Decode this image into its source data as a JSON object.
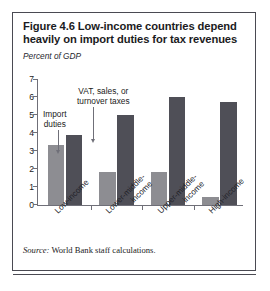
{
  "figure": {
    "title": "Figure 4.6  Low-income countries depend heavily on import duties for tax revenues",
    "source": "Source: World Bank staff calculations.",
    "source_prefix": "Source:",
    "source_body": " World Bank staff calculations."
  },
  "annotations": {
    "import_duties": "Import\nduties",
    "import_duties_line1": "Import",
    "import_duties_line2": "duties",
    "vat_line1": "VAT, sales, or",
    "vat_line2": "turnover taxes"
  },
  "colors": {
    "import_duties_bar": "#8d8d92",
    "vat_bar": "#4f4f57",
    "axis": "#6f6f78",
    "frame": "#4a4a52",
    "text": "#1b1b22"
  },
  "chart_data": {
    "type": "bar",
    "title": "Figure 4.6  Low-income countries depend heavily on import duties for tax revenues",
    "subtitle": "",
    "xlabel": "",
    "ylabel": "Percent of GDP",
    "ylim": [
      0,
      7
    ],
    "yticks": [
      0,
      1,
      2,
      3,
      4,
      5,
      6,
      7
    ],
    "ytick_labels": [
      "0",
      "1",
      "2",
      "3",
      "4",
      "5",
      "6",
      "7"
    ],
    "grid": false,
    "legend": "annotated-arrows",
    "categories": [
      "Low-income",
      "Lower-middle-income",
      "Upper-middle-income",
      "High-income"
    ],
    "category_label_lines": [
      [
        "Low-income"
      ],
      [
        "Lower-middle-",
        "income"
      ],
      [
        "Upper-middle-",
        "income"
      ],
      [
        "High-income"
      ]
    ],
    "series": [
      {
        "name": "Import duties",
        "color": "#8d8d92",
        "values": [
          3.3,
          1.8,
          1.8,
          0.45
        ]
      },
      {
        "name": "VAT, sales, or turnover taxes",
        "color": "#4f4f57",
        "values": [
          3.9,
          5.0,
          6.0,
          5.7
        ]
      }
    ]
  }
}
